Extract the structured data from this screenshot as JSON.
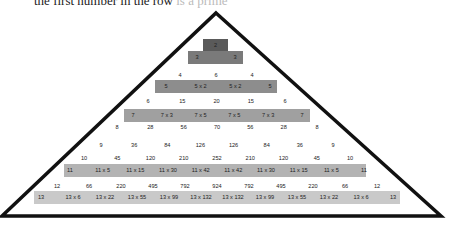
{
  "caption": {
    "text": "the first number in the row",
    "faded": " is a prime"
  },
  "colors": {
    "band2": "#5a5a5a",
    "band3": "#7a7a7a",
    "band5": "#8d8d8d",
    "band7": "#a0a0a0",
    "band11": "#b3b3b3",
    "band13": "#c9c9c9",
    "outline": "#111111"
  },
  "rows": {
    "r2": [
      "2"
    ],
    "r3": [
      "3",
      "3"
    ],
    "r4": [
      "4",
      "6",
      "4"
    ],
    "r5": [
      "5",
      "5 x 2",
      "5 x 2",
      "5"
    ],
    "r6": [
      "6",
      "15",
      "20",
      "15",
      "6"
    ],
    "r7": [
      "7",
      "7 x 3",
      "7 x 5",
      "7 x 5",
      "7 x 3",
      "7"
    ],
    "r8": [
      "8",
      "28",
      "56",
      "70",
      "56",
      "28",
      "8"
    ],
    "r9": [
      "9",
      "36",
      "84",
      "126",
      "126",
      "84",
      "36",
      "9"
    ],
    "r10": [
      "10",
      "45",
      "120",
      "210",
      "252",
      "210",
      "120",
      "45",
      "10"
    ],
    "r11": [
      "11",
      "11 x 5",
      "11 x 15",
      "11 x 30",
      "11 x 42",
      "11 x 42",
      "11 x 30",
      "11 x 15",
      "11 x 5",
      "11"
    ],
    "r12": [
      "12",
      "66",
      "220",
      "495",
      "792",
      "924",
      "792",
      "495",
      "220",
      "66",
      "12"
    ],
    "r13": [
      "13",
      "13 x 6",
      "13 x 22",
      "13 x 55",
      "13 x 99",
      "13 x 132",
      "13 x 132",
      "13 x 99",
      "13 x 55",
      "13 x 22",
      "13 x 6",
      "13"
    ]
  }
}
